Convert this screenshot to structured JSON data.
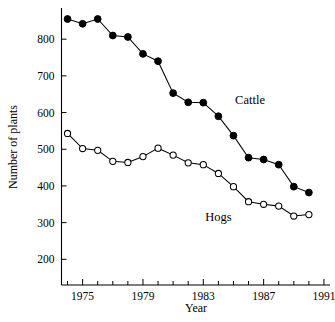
{
  "chart_data": {
    "type": "line",
    "title": "",
    "xlabel": "Year",
    "ylabel": "Number of plants",
    "x": [
      1974,
      1975,
      1976,
      1977,
      1978,
      1979,
      1980,
      1981,
      1982,
      1983,
      1984,
      1985,
      1986,
      1987,
      1988,
      1989,
      1990
    ],
    "xlim": [
      1973.6,
      1991.4
    ],
    "ylim": [
      130,
      885
    ],
    "xticks": [
      1974,
      1975,
      1976,
      1977,
      1978,
      1979,
      1980,
      1981,
      1982,
      1983,
      1984,
      1985,
      1986,
      1987,
      1988,
      1989,
      1990,
      1991
    ],
    "xticklabels": [
      "1975",
      "1979",
      "1983",
      "1987",
      "1991"
    ],
    "xticklabel_values": [
      1975,
      1979,
      1983,
      1987,
      1991
    ],
    "yticks": [
      200,
      300,
      400,
      500,
      600,
      700,
      800
    ],
    "yticklabels": [
      "200",
      "300",
      "400",
      "500",
      "600",
      "700",
      "800"
    ],
    "grid": false,
    "legend_position": "inline-annotations",
    "series": [
      {
        "name": "Cattle",
        "marker": "filled-circle",
        "values": [
          855,
          842,
          855,
          810,
          806,
          760,
          740,
          653,
          628,
          627,
          590,
          537,
          477,
          472,
          458,
          398,
          382
        ],
        "label_x": 1986.1,
        "label_y": 622
      },
      {
        "name": "Hogs",
        "marker": "open-circle",
        "values": [
          543,
          502,
          497,
          467,
          464,
          480,
          503,
          484,
          463,
          458,
          434,
          398,
          357,
          350,
          345,
          318,
          322
        ],
        "label_x": 1984.0,
        "label_y": 305
      }
    ],
    "annotations": [
      {
        "text": "Cattle",
        "series": "Cattle"
      },
      {
        "text": "Hogs",
        "series": "Hogs"
      }
    ]
  },
  "axis": {
    "y_title": "Number of plants",
    "x_title": "Year"
  }
}
